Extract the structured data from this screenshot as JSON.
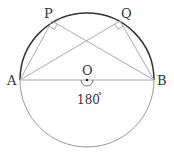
{
  "diagram": {
    "colors": {
      "upper_arc": "#333333",
      "lower_arc": "#999999",
      "lines": "#aaaaaa",
      "text": "#333333"
    },
    "circle": {
      "center": "O",
      "cx": 87,
      "cy": 80,
      "r": 67
    },
    "points": [
      {
        "name": "A",
        "label": "A",
        "x": 20,
        "y": 80
      },
      {
        "name": "B",
        "label": "B",
        "x": 154,
        "y": 80
      },
      {
        "name": "P",
        "label": "P",
        "x": 52,
        "y": 21
      },
      {
        "name": "Q",
        "label": "Q",
        "x": 120,
        "y": 21
      },
      {
        "name": "O",
        "label": "O",
        "x": 87,
        "y": 80
      }
    ],
    "segments": [
      "AB",
      "AP",
      "PB",
      "AQ",
      "QB"
    ],
    "right_angles": [
      "APB",
      "AQB"
    ],
    "central_angle_label": "180",
    "degree_symbol": "°"
  }
}
